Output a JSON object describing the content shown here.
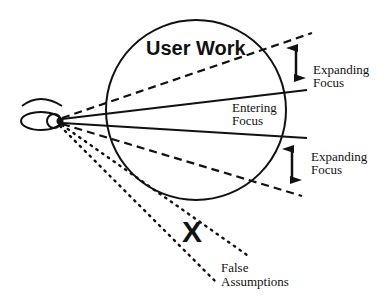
{
  "diagram": {
    "title": "User Work",
    "labels": {
      "expanding_focus_top": [
        "Expanding",
        "Focus"
      ],
      "entering_focus": [
        "Entering",
        "Focus"
      ],
      "expanding_focus_bottom": [
        "Expanding",
        "Focus"
      ],
      "false_assumptions": [
        "False",
        "Assumptions"
      ]
    },
    "x_mark": "X",
    "elements": {
      "eye": "eye-icon",
      "work_circle": "circle",
      "focus_lines": "solid lines",
      "expanding_lines": "dashed lines",
      "false_assumption_lines": "dotted lines",
      "expansion_arrows": "double-headed arrows"
    },
    "colors": {
      "stroke": "#111111",
      "background": "#ffffff"
    }
  }
}
